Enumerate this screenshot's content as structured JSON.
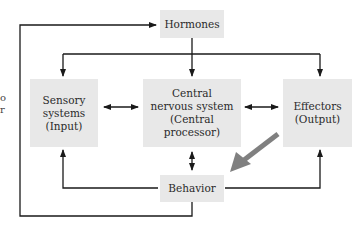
{
  "diagram": {
    "nodes": {
      "hormones": {
        "lines": [
          "Hormones"
        ]
      },
      "sensory": {
        "lines": [
          "Sensory",
          "systems",
          "(Input)"
        ]
      },
      "cns": {
        "lines": [
          "Central",
          "nervous system",
          "(Central processor)"
        ]
      },
      "effectors": {
        "lines": [
          "Effectors",
          "(Output)"
        ]
      },
      "behavior": {
        "lines": [
          "Behavior"
        ]
      }
    },
    "edges": [
      {
        "from": "behavior",
        "to": "hormones",
        "type": "outer-feedback-loop"
      },
      {
        "from": "hormones",
        "to": "sensory",
        "type": "arrow"
      },
      {
        "from": "hormones",
        "to": "cns",
        "type": "arrow"
      },
      {
        "from": "hormones",
        "to": "effectors",
        "type": "arrow"
      },
      {
        "from": "sensory",
        "to": "cns",
        "type": "bidirectional"
      },
      {
        "from": "cns",
        "to": "effectors",
        "type": "bidirectional"
      },
      {
        "from": "cns",
        "to": "behavior",
        "type": "bidirectional"
      },
      {
        "from": "behavior",
        "to": "sensory",
        "type": "arrow"
      },
      {
        "from": "behavior",
        "to": "effectors",
        "type": "arrow"
      }
    ],
    "highlight_arrow": {
      "from": "effectors",
      "to": "behavior",
      "color": "#808080"
    },
    "colors": {
      "box_fill": "#e8e8e8",
      "line": "#1a1a1a",
      "text": "#2a2a2a"
    },
    "left_edge_fragments": [
      "o",
      "r"
    ]
  }
}
